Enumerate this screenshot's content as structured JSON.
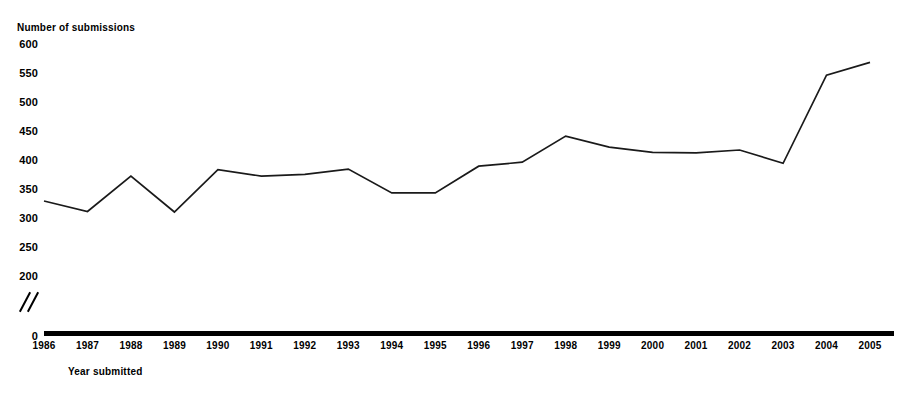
{
  "chart_data": {
    "type": "line",
    "title": "",
    "subtitle": "",
    "xlabel": "Year submitted",
    "ylabel": "Number of submissions",
    "categories": [
      "1986",
      "1987",
      "1988",
      "1989",
      "1990",
      "1991",
      "1992",
      "1993",
      "1994",
      "1995",
      "1996",
      "1997",
      "1998",
      "1999",
      "2000",
      "2001",
      "2002",
      "2003",
      "2004",
      "2005"
    ],
    "x": [
      1986,
      1987,
      1988,
      1989,
      1990,
      1991,
      1992,
      1993,
      1994,
      1995,
      1996,
      1997,
      1998,
      1999,
      2000,
      2001,
      2002,
      2003,
      2004,
      2005
    ],
    "values": [
      331,
      313,
      374,
      312,
      385,
      374,
      377,
      386,
      345,
      345,
      391,
      398,
      443,
      424,
      415,
      414,
      419,
      396,
      548,
      570
    ],
    "series": [
      {
        "name": "Number of submissions",
        "values": [
          331,
          313,
          374,
          312,
          385,
          374,
          377,
          386,
          345,
          345,
          391,
          398,
          443,
          424,
          415,
          414,
          419,
          396,
          548,
          570
        ]
      }
    ],
    "ytick_labels": [
      "600",
      "550",
      "500",
      "450",
      "400",
      "350",
      "300",
      "250",
      "200"
    ],
    "ytick_values": [
      600,
      550,
      500,
      450,
      400,
      350,
      300,
      250,
      200
    ],
    "zero_label": "0",
    "ylim": [
      200,
      600
    ],
    "axis_break": true,
    "axis_break_symbol": "double-slash",
    "grid": false,
    "legend": false,
    "line_color": "#1a1a1a",
    "axis_color": "#000000",
    "background_color": "#ffffff"
  }
}
